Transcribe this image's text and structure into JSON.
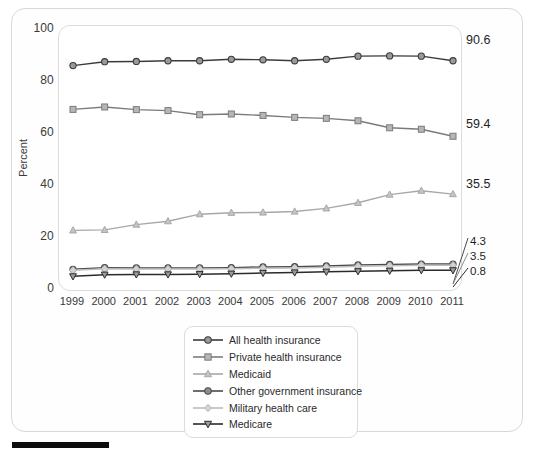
{
  "figure": {
    "axis_label_y": "Percent",
    "y_ticks": [
      "100",
      "80",
      "60",
      "40",
      "20",
      "0"
    ],
    "bottom_bar_color": "#0c0c0c"
  },
  "end_labels": {
    "all": "90.6",
    "private": "59.4",
    "medicaid": "35.5",
    "other_gov": "4.3",
    "military": "3.5",
    "medicare": "0.8"
  },
  "legend": {
    "items": [
      {
        "label": "All health insurance",
        "marker": "circle-marker",
        "color": "#3b3b3b"
      },
      {
        "label": "Private health insurance",
        "marker": "square-marker",
        "color": "#7b7b7b"
      },
      {
        "label": "Medicaid",
        "marker": "triangle-up-marker",
        "color": "#a8a8a8"
      },
      {
        "label": "Other government insurance",
        "marker": "circle-cross-marker",
        "color": "#4a4a4a"
      },
      {
        "label": "Military health care",
        "marker": "diamond-marker",
        "color": "#bdbdbd"
      },
      {
        "label": "Medicare",
        "marker": "triangle-down-marker",
        "color": "#2b2b2b"
      }
    ]
  },
  "chart_data": {
    "type": "line",
    "title": "",
    "xlabel": "",
    "ylabel": "Percent",
    "xlim": [
      1999,
      2011
    ],
    "ylim": [
      0,
      100
    ],
    "yticks": [
      0,
      20,
      40,
      60,
      80,
      100
    ],
    "grid": false,
    "legend_position": "bottom-center",
    "categories": [
      "1999",
      "2000",
      "2001",
      "2002",
      "2003",
      "2004",
      "2005",
      "2006",
      "2007",
      "2008",
      "2009",
      "2010",
      "2011"
    ],
    "x": [
      1999,
      2000,
      2001,
      2002,
      2003,
      2004,
      2005,
      2006,
      2007,
      2008,
      2009,
      2010,
      2011
    ],
    "series": [
      {
        "name": "All health insurance",
        "color": "#3b3b3b",
        "marker": "circle",
        "end_value_label": "90.6",
        "values": [
          88.6,
          90.2,
          90.3,
          90.6,
          90.6,
          91.2,
          91.0,
          90.6,
          91.2,
          92.5,
          92.6,
          92.5,
          90.6
        ]
      },
      {
        "name": "Private health insurance",
        "color": "#7b7b7b",
        "marker": "square",
        "end_value_label": "59.4",
        "values": [
          70.5,
          71.5,
          70.4,
          70.0,
          68.3,
          68.6,
          68.0,
          67.2,
          66.8,
          65.8,
          62.9,
          62.3,
          59.4
        ]
      },
      {
        "name": "Medicaid",
        "color": "#a8a8a8",
        "marker": "triangle-up",
        "end_value_label": "35.5",
        "values": [
          20.5,
          20.7,
          22.9,
          24.3,
          27.2,
          27.8,
          27.9,
          28.3,
          29.6,
          31.9,
          35.3,
          36.9,
          35.5
        ]
      },
      {
        "name": "Other government insurance",
        "color": "#4a4a4a",
        "marker": "circle-cross",
        "end_value_label": "4.3",
        "values": [
          4.4,
          5.1,
          5.0,
          5.0,
          5.0,
          5.1,
          5.4,
          5.5,
          5.8,
          6.2,
          6.4,
          6.6,
          4.3
        ]
      },
      {
        "name": "Military health care",
        "color": "#bdbdbd",
        "marker": "diamond",
        "end_value_label": "3.5",
        "values": [
          4.0,
          4.6,
          4.5,
          4.5,
          4.5,
          4.6,
          4.9,
          5.0,
          5.3,
          5.7,
          5.9,
          6.1,
          3.5
        ]
      },
      {
        "name": "Medicare",
        "color": "#2b2b2b",
        "marker": "triangle-down",
        "end_value_label": "0.8",
        "values": [
          1.5,
          2.2,
          2.3,
          2.3,
          2.4,
          2.6,
          2.9,
          3.1,
          3.4,
          3.6,
          3.8,
          4.0,
          0.8
        ]
      }
    ]
  }
}
